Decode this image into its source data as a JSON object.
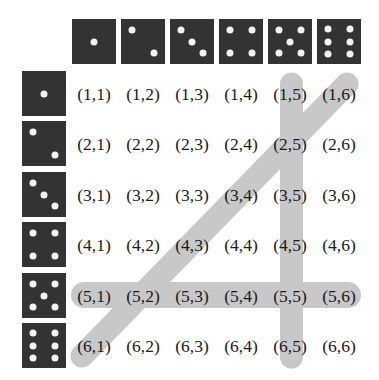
{
  "colors": {
    "die_face": "#333333",
    "pip": "#f2f2f2",
    "band": "#b4b4b4",
    "text": "#1a1a1a"
  },
  "column_dice": [
    1,
    2,
    3,
    4,
    5,
    6
  ],
  "row_dice": [
    1,
    2,
    3,
    4,
    5,
    6
  ],
  "grid": [
    [
      "(1,1)",
      "(1,2)",
      "(1,3)",
      "(1,4)",
      "(1,5)",
      "(1,6)"
    ],
    [
      "(2,1)",
      "(2,2)",
      "(2,3)",
      "(2,4)",
      "(2,5)",
      "(2,6)"
    ],
    [
      "(3,1)",
      "(3,2)",
      "(3,3)",
      "(3,4)",
      "(3,5)",
      "(3,6)"
    ],
    [
      "(4,1)",
      "(4,2)",
      "(4,3)",
      "(4,4)",
      "(4,5)",
      "(4,6)"
    ],
    [
      "(5,1)",
      "(5,2)",
      "(5,3)",
      "(5,4)",
      "(5,5)",
      "(5,6)"
    ],
    [
      "(6,1)",
      "(6,2)",
      "(6,3)",
      "(6,4)",
      "(6,5)",
      "(6,6)"
    ]
  ],
  "highlights": [
    {
      "name": "row-first-die-5",
      "type": "row",
      "index": 5
    },
    {
      "name": "column-second-die-5",
      "type": "column",
      "index": 5
    },
    {
      "name": "anti-diagonal-sum-7",
      "type": "diagonal",
      "cells": [
        "(1,6)",
        "(2,5)",
        "(3,4)",
        "(4,3)",
        "(5,2)",
        "(6,1)"
      ]
    }
  ]
}
